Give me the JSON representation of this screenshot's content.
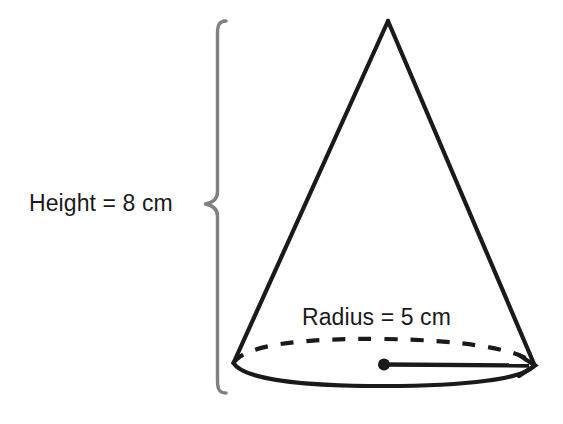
{
  "figure": {
    "name": "cone-with-dimensions",
    "shape": "cone",
    "background_color": "#ffffff",
    "stroke_color": "#1a1a1a",
    "brace_color": "#808080",
    "labels": {
      "height": "Height = 8 cm",
      "radius": "Radius = 5 cm"
    },
    "measurements": {
      "height_value": "8",
      "height_unit": "cm",
      "radius_value": "5",
      "radius_unit": "cm"
    },
    "geometry": {
      "apex": {
        "x": 388,
        "y": 20
      },
      "base_center": {
        "x": 384,
        "y": 364
      },
      "base_left": {
        "x": 233,
        "y": 363
      },
      "base_right": {
        "x": 535,
        "y": 366
      },
      "base_rx": 151,
      "base_ry": 20,
      "brace_top_y": 20,
      "brace_bottom_y": 393,
      "brace_tip": {
        "x": 205,
        "y": 204
      },
      "brace_x": 218
    }
  }
}
